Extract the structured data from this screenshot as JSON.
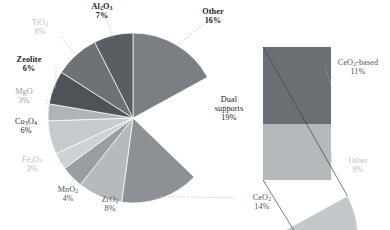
{
  "chart_data": {
    "type": "pie",
    "title": "",
    "subtitle": "",
    "xlabel": "",
    "ylabel": "",
    "legend_position": "none",
    "grid": false,
    "units": "percent",
    "total": 100,
    "categories": [
      "Other",
      "Dual supports",
      "CeO2",
      "ZrO2",
      "MnO2",
      "Fe2O3",
      "Co3O4",
      "MgO",
      "Zeolite",
      "TiO2",
      "Al2O3"
    ],
    "values": [
      16,
      19,
      14,
      8,
      4,
      3,
      6,
      3,
      6,
      8,
      7
    ],
    "exploded_slice": "Dual supports",
    "breakout": {
      "type": "bar",
      "parent": "Dual supports",
      "parent_value": 19,
      "categories": [
        "CeO2-based",
        "Other"
      ],
      "values": [
        11,
        8
      ]
    },
    "slices": [
      {
        "key": "other",
        "name_html": "Other",
        "percent_label": "16%",
        "value": 16,
        "color": "#7b7f83",
        "emphasis": "bold",
        "label_color": "dark"
      },
      {
        "key": "dual",
        "name_html": "Dual<br>supports",
        "percent_label": "19%",
        "value": 19,
        "color": "#c3c7c9",
        "emphasis": "plain",
        "label_color": "dark"
      },
      {
        "key": "ceo2",
        "name_html": "CeO<sub>2</sub>",
        "percent_label": "14%",
        "value": 14,
        "color": "#8d9195",
        "emphasis": "plain",
        "label_color": "mid"
      },
      {
        "key": "zro2",
        "name_html": "ZrO<sub>2</sub>",
        "percent_label": "8%",
        "value": 8,
        "color": "#b6babd",
        "emphasis": "plain",
        "label_color": "mid"
      },
      {
        "key": "mno2",
        "name_html": "MnO<sub>2</sub>",
        "percent_label": "4%",
        "value": 4,
        "color": "#9a9ea1",
        "emphasis": "plain",
        "label_color": "mid"
      },
      {
        "key": "fe2o3",
        "name_html": "Fe<sub>2</sub>O<sub>3</sub>",
        "percent_label": "3%",
        "value": 3,
        "color": "#cfd2d4",
        "emphasis": "plain",
        "label_color": "pale"
      },
      {
        "key": "co3o4",
        "name_html": "Co<sub>3</sub>O<sub>4</sub>",
        "percent_label": "6%",
        "value": 6,
        "color": "#c8cbce",
        "emphasis": "plain",
        "label_color": "dark"
      },
      {
        "key": "mgo",
        "name_html": "MgO",
        "percent_label": "3%",
        "value": 3,
        "color": "#b0b4b7",
        "emphasis": "plain",
        "label_color": "faint"
      },
      {
        "key": "zeolite",
        "name_html": "Zeolite",
        "percent_label": "6%",
        "value": 6,
        "color": "#4f5357",
        "emphasis": "bold",
        "label_color": "dark"
      },
      {
        "key": "tio2",
        "name_html": "TiO<sub>2</sub>",
        "percent_label": "8%",
        "value": 8,
        "color": "#6e7276",
        "emphasis": "plain",
        "label_color": "pale"
      },
      {
        "key": "al2o3",
        "name_html": "Al<sub>2</sub>O<sub>3</sub>",
        "percent_label": "7%",
        "value": 7,
        "color": "#5a5e62",
        "emphasis": "bold",
        "label_color": "dark"
      }
    ],
    "bar_segments": [
      {
        "key": "ceo2_based",
        "name_html": "CeO<sub>2</sub>-based",
        "percent_label": "11%",
        "value": 11,
        "color": "#6b6f73",
        "label_color": "mid"
      },
      {
        "key": "bar_other",
        "name_html": "Other",
        "percent_label": "8%",
        "value": 8,
        "color": "#b5b9bc",
        "label_color": "pale"
      }
    ]
  },
  "labels": {
    "al2o3": {
      "name": "Al2O3",
      "percent": "7%"
    },
    "tio2": {
      "name": "TiO2",
      "percent": "8%"
    },
    "zeolite": {
      "name": "Zeolite",
      "percent": "6%"
    },
    "mgo": {
      "name": "MgO",
      "percent": "3%"
    },
    "co3o4": {
      "name": "Co3O4",
      "percent": "6%"
    },
    "fe2o3": {
      "name": "Fe2O3",
      "percent": "3%"
    },
    "mno2": {
      "name": "MnO2",
      "percent": "4%"
    },
    "zro2": {
      "name": "ZrO2",
      "percent": "8%"
    },
    "ceo2": {
      "name": "CeO2",
      "percent": "14%"
    },
    "other": {
      "name": "Other",
      "percent": "16%"
    },
    "dual": {
      "name": "Dual supports",
      "percent": "19%"
    },
    "ceo2_based": {
      "name": "CeO2-based",
      "percent": "11%"
    },
    "bar_other": {
      "name": "Other",
      "percent": "8%"
    }
  }
}
